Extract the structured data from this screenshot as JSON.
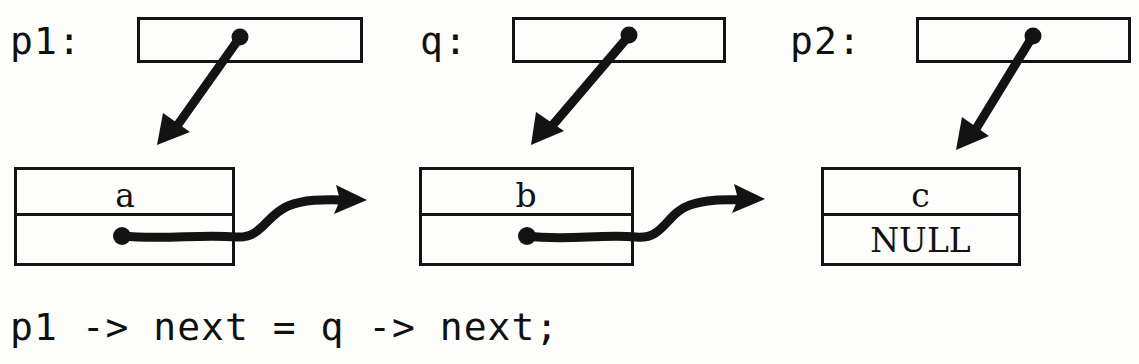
{
  "diagram": {
    "ink_color": "#131313",
    "background_color": "#fdfdfc",
    "pointers": [
      {
        "id": "p1",
        "label": "p1:",
        "box_x": 137,
        "box_y": 17,
        "box_w": 225,
        "box_h": 45,
        "dot_x": 240,
        "dot_y": 39,
        "arrow_end_x": 168,
        "arrow_end_y": 140
      },
      {
        "id": "q",
        "label": "q:",
        "box_x": 512,
        "box_y": 17,
        "box_w": 213,
        "box_h": 45,
        "dot_x": 629,
        "dot_y": 37,
        "arrow_end_x": 541,
        "arrow_end_y": 140
      },
      {
        "id": "p2",
        "label": "p2:",
        "box_x": 916,
        "box_y": 17,
        "box_w": 214,
        "box_h": 45,
        "dot_x": 1033,
        "dot_y": 38,
        "arrow_end_x": 966,
        "arrow_end_y": 144
      }
    ],
    "pointer_labels": [
      {
        "text": "p1:",
        "x": 10,
        "y": 22
      },
      {
        "text": "q:",
        "x": 420,
        "y": 22
      },
      {
        "text": "p2:",
        "x": 790,
        "y": 22
      }
    ],
    "nodes": [
      {
        "id": "node-a",
        "data": "a",
        "next_value": "",
        "x": 14,
        "y": 167,
        "w": 220,
        "h": 98,
        "divider_y": 214,
        "dot_x": 122,
        "dot_y": 236,
        "has_next_arrow": true,
        "next_arrow_end_x": 362,
        "next_arrow_end_y": 200
      },
      {
        "id": "node-b",
        "data": "b",
        "next_value": "",
        "x": 419,
        "y": 167,
        "w": 214,
        "h": 98,
        "divider_y": 214,
        "dot_x": 527,
        "dot_y": 236,
        "has_next_arrow": true,
        "next_arrow_end_x": 760,
        "next_arrow_end_y": 200
      },
      {
        "id": "node-c",
        "data": "c",
        "next_value": "NULL",
        "x": 821,
        "y": 167,
        "w": 199,
        "h": 98,
        "divider_y": 214,
        "dot_x": 0,
        "dot_y": 0,
        "has_next_arrow": false,
        "next_arrow_end_x": 0,
        "next_arrow_end_y": 0
      }
    ],
    "code": {
      "text": "p1 -> next = q -> next;",
      "x": 10,
      "y": 308
    }
  }
}
